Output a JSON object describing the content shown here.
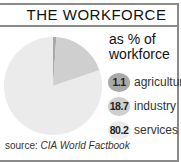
{
  "title": "THE WORKFORCE",
  "subtitle_line1": "as % of",
  "subtitle_line2": "workforce",
  "source_prefix": "source:",
  "source_name": "CIA World Factbook",
  "legend": [
    {
      "value": "1.1",
      "label": "agriculture",
      "color": "#a9a9a9"
    },
    {
      "value": "18.7",
      "label": "industry",
      "color": "#cfcfcf"
    },
    {
      "value": "80.2",
      "label": "services",
      "color": "#ebebeb"
    }
  ],
  "chart_data": {
    "type": "pie",
    "title": "THE WORKFORCE",
    "subtitle": "as % of workforce",
    "categories": [
      "agriculture",
      "industry",
      "services"
    ],
    "values": [
      1.1,
      18.7,
      80.2
    ],
    "colors": [
      "#a9a9a9",
      "#cfcfcf",
      "#ebebeb"
    ],
    "start_angle": "12 o'clock, clockwise",
    "legend_position": "right",
    "source": "CIA World Factbook"
  }
}
